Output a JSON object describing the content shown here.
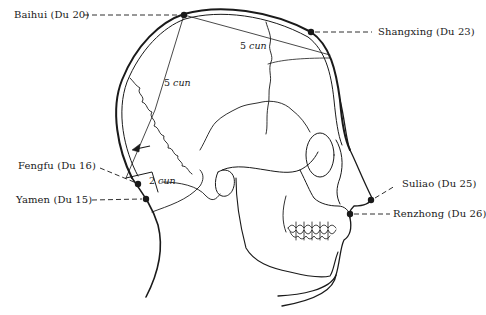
{
  "colors": {
    "ink": "#1a1a1a",
    "background": "#ffffff"
  },
  "points": [
    {
      "id": "baihui",
      "label": "Baihui (Du 20)",
      "x": 184,
      "y": 15
    },
    {
      "id": "shangxing",
      "label": "Shangxing (Du 23)",
      "x": 311,
      "y": 32
    },
    {
      "id": "fengfu",
      "label": "Fengfu (Du 16)",
      "x": 138,
      "y": 184
    },
    {
      "id": "yamen",
      "label": "Yamen (Du 15)",
      "x": 146,
      "y": 199
    },
    {
      "id": "suliao",
      "label": "Suliao (Du 25)",
      "x": 371,
      "y": 200
    },
    {
      "id": "renzhong",
      "label": "Renzhong (Du 26)",
      "x": 350,
      "y": 214
    }
  ],
  "measurements": [
    {
      "id": "crown-to-forehead",
      "value": "5",
      "unit": "cun"
    },
    {
      "id": "crown-to-occiput",
      "value": "5",
      "unit": "cun"
    },
    {
      "id": "occiput-to-nape",
      "value": "2",
      "unit": "cun"
    }
  ],
  "icons": {
    "arrow": "arrow-left-icon",
    "point": "acupoint-dot-icon"
  }
}
